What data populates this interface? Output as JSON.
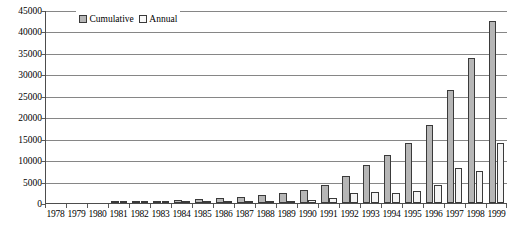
{
  "chart_data": {
    "type": "bar",
    "title": "",
    "subtitle": "",
    "xlabel": "",
    "ylabel": "",
    "ylim": [
      0,
      45000
    ],
    "ytick_labels": [
      "45000",
      "40000",
      "35000",
      "30000",
      "25000",
      "20000",
      "15000",
      "10000",
      "5000",
      "0"
    ],
    "ytick_values": [
      45000,
      40000,
      35000,
      30000,
      25000,
      20000,
      15000,
      10000,
      5000,
      0
    ],
    "grid": true,
    "legend_position": "top-center",
    "categories": [
      "1978",
      "1979",
      "1980",
      "1981",
      "1982",
      "1983",
      "1984",
      "1985",
      "1986",
      "1987",
      "1988",
      "1989",
      "1990",
      "1991",
      "1992",
      "1993",
      "1994",
      "1995",
      "1996",
      "1997",
      "1998",
      "1999"
    ],
    "series": [
      {
        "name": "Cumulative",
        "color": "#b6b6b6",
        "values": [
          0,
          0,
          0,
          100,
          300,
          500,
          700,
          900,
          1200,
          1500,
          1900,
          2400,
          3000,
          4100,
          6400,
          8900,
          11200,
          14000,
          18100,
          26300,
          33800,
          42500
        ]
      },
      {
        "name": "Annual",
        "color": "#f4f4f4",
        "values": [
          0,
          0,
          0,
          100,
          200,
          200,
          200,
          200,
          300,
          300,
          400,
          500,
          600,
          1100,
          2300,
          2500,
          2300,
          2800,
          4100,
          8200,
          7500,
          14000
        ]
      }
    ]
  },
  "legend": {
    "entries": [
      {
        "label": "Cumulative",
        "swatch": "legend-swatch-cumulative"
      },
      {
        "label": "Annual",
        "swatch": "legend-swatch-annual"
      }
    ]
  },
  "colors": {
    "cumulative_fill": "#b6b6b6",
    "annual_fill": "#f4f4f4",
    "bar_outline": "#3a3a3a",
    "gridline": "#868686",
    "axis": "#4d4d4d",
    "background": "#ffffff",
    "text": "#000000"
  }
}
